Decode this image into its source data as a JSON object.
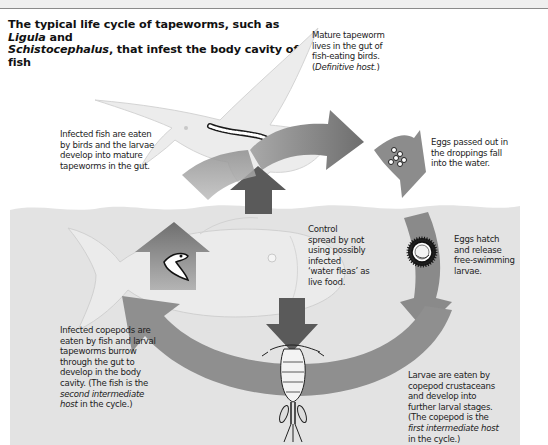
{
  "title": {
    "part1": "The typical life cycle of tapeworms, such as ",
    "genus1": "Ligula",
    "part2": " and ",
    "genus2": "Schistocephalus",
    "part3": ", that infest the body cavity of fish"
  },
  "labels": {
    "mature": {
      "line1": "Mature tapeworm",
      "line2": "lives in the gut of",
      "line3": "fish-eating birds.",
      "line4_open": "(",
      "line4_italic": "Definitive host.",
      "line4_close": ")"
    },
    "infected_fish": {
      "line1": "Infected fish are eaten",
      "line2": "by birds and the larvae",
      "line3": "develop into mature",
      "line4": "tapeworms in the gut."
    },
    "eggs_passed": {
      "line1": "Eggs passed out in",
      "line2": "the droppings fall",
      "line3": "into the water."
    },
    "control": {
      "line1": "Control",
      "line2": "spread by not",
      "line3": "using possibly",
      "line4": "infected",
      "line5": "‘water fleas’ as",
      "line6": "live food."
    },
    "eggs_hatch": {
      "line1": "Eggs hatch",
      "line2": "and release",
      "line3": "free-swimming",
      "line4": "larvae."
    },
    "copepods_eaten": {
      "line1": "Infected copepods are",
      "line2": "eaten by fish and larval",
      "line3": "tapeworms burrow",
      "line4": "through the gut to",
      "line5": "develop in the body",
      "line6": "cavity. (The fish is the",
      "line7_italic": "second intermediate",
      "line8_italic": "host",
      "line8_rest": " in the cycle.)"
    },
    "larvae_eaten": {
      "line1": "Larvae are eaten by",
      "line2": "copepod crustaceans",
      "line3": "and develop into",
      "line4": "further larval stages.",
      "line5": "(The copepod is the",
      "line6_italic": "first intermediate host",
      "line7": "in the cycle.)"
    }
  },
  "colors": {
    "water": "#e3e3e3",
    "arrow_mid": "#8e8e8e",
    "arrow_dark": "#5a5a5a",
    "bird": "#ececec",
    "fish": "#ebebeb",
    "text": "#1d1d1d"
  },
  "icons": [
    "bird-icon",
    "tapeworm-icon",
    "eggs-icon",
    "egg-hatch-larva-icon",
    "fish-icon",
    "larval-tapeworm-icon",
    "copepod-icon"
  ]
}
